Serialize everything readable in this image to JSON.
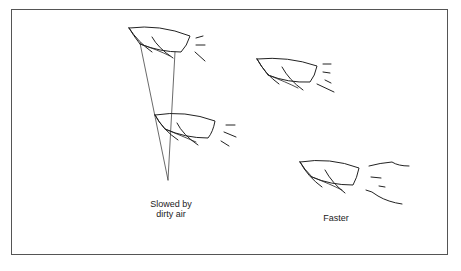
{
  "diagram": {
    "labels": {
      "slowed": "Slowed by\ndirty air",
      "faster": "Faster"
    },
    "boats": [
      {
        "id": "boat-top-left",
        "role": "leading boat creating dirty air"
      },
      {
        "id": "boat-mid-left",
        "role": "boat slowed by dirty air"
      },
      {
        "id": "boat-top-right",
        "role": "boat in clear air"
      },
      {
        "id": "boat-bottom-right",
        "role": "faster boat in clear air"
      }
    ],
    "colors": {
      "stroke": "#222222",
      "wind_shadow": "#444444",
      "border": "#555555",
      "background": "#ffffff"
    }
  }
}
